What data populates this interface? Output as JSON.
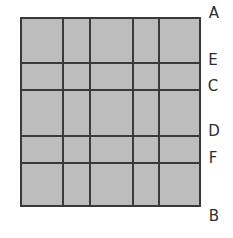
{
  "diagram": {
    "fill_color": "#bdbdbd",
    "line_color": "#3a3a3a",
    "box": {
      "left": 20,
      "top": 17,
      "width": 181,
      "height": 190
    },
    "vertical_lines_x": [
      42,
      69,
      112,
      138
    ],
    "horizontal_lines_y": [
      45,
      72,
      118,
      145
    ],
    "labels": [
      {
        "text": "A",
        "x": 214,
        "y": 13
      },
      {
        "text": "E",
        "x": 213,
        "y": 60
      },
      {
        "text": "C",
        "x": 213,
        "y": 86
      },
      {
        "text": "D",
        "x": 214,
        "y": 131
      },
      {
        "text": "F",
        "x": 213,
        "y": 158
      },
      {
        "text": "B",
        "x": 214,
        "y": 216
      }
    ]
  }
}
